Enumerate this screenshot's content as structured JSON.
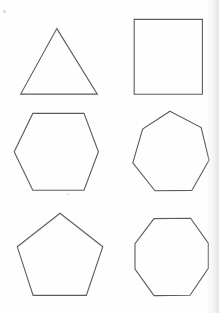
{
  "document": {
    "title": "Regular polygons figure sheet",
    "background_color": "#fefefe",
    "stroke_color": "#5b5b5f",
    "stroke_width": 1.1,
    "fill_color": "none",
    "width": 219,
    "height": 313
  },
  "figures": [
    {
      "id": "triangle",
      "name": "triangle",
      "sides": 3,
      "label": "Triangle",
      "row": 1,
      "column": 1,
      "points": "56.8,28.6 97.3,94.1 20.7,94.1"
    },
    {
      "id": "square",
      "name": "square",
      "sides": 4,
      "label": "Square",
      "row": 1,
      "column": 2,
      "points": "134.2,19.4 202.4,19.4 202.4,94.2 134.2,94.2"
    },
    {
      "id": "hexagon",
      "name": "hexagon",
      "sides": 6,
      "label": "Hexagon",
      "row": 2,
      "column": 1,
      "points": "32.8,113.4 84.0,113.4 98.4,151.8 84.0,190.2 32.8,190.2 14.2,151.8"
    },
    {
      "id": "heptagon",
      "name": "heptagon",
      "sides": 7,
      "label": "Heptagon",
      "row": 2,
      "column": 2,
      "points": "170.0,111.2 201.2,127.6 209.0,160.2 191.8,190.4 155.0,190.8 132.8,162.8 142.6,129.0"
    },
    {
      "id": "pentagon",
      "name": "pentagon",
      "sides": 5,
      "label": "Pentagon",
      "row": 3,
      "column": 1,
      "points": "60.0,213.2 102.8,246.8 86.3,295.4 33.1,295.4 17.3,246.8"
    },
    {
      "id": "octagon",
      "name": "octagon",
      "sides": 8,
      "label": "Octagon",
      "row": 3,
      "column": 2,
      "points": "154.0,218.6 190.6,218.2 208.3,243.2 208.3,268.4 190.0,295.2 154.0,295.6 135.0,269.0 135.0,243.6"
    }
  ],
  "artifacts": [
    {
      "id": "speck-corner",
      "name": "scan-speck-top-left"
    },
    {
      "id": "speck-mid",
      "name": "scan-speck-mid"
    }
  ]
}
